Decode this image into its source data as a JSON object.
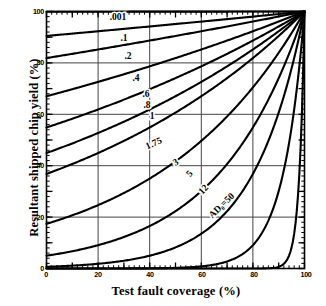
{
  "chart_data": {
    "type": "line",
    "title": "",
    "xlabel": "Test fault coverage (%)",
    "ylabel": "Resultant shipped chip yield (%)",
    "xlim": [
      0,
      100
    ],
    "ylim": [
      0,
      100
    ],
    "xticks": [
      "0",
      "20",
      "40",
      "60",
      "80",
      "100"
    ],
    "yticks": [
      "0",
      "20",
      "40",
      "60",
      "80",
      "100"
    ],
    "xtick_values": [
      0,
      20,
      40,
      60,
      80,
      100
    ],
    "ytick_values": [
      0,
      20,
      40,
      60,
      80,
      100
    ],
    "grid": true,
    "grid_x": [
      20,
      40,
      60,
      80
    ],
    "grid_y": [
      20,
      40,
      60,
      80
    ],
    "legend": "inline curve labels",
    "legend_position": "inline",
    "annotation": "AD₀=50",
    "model": "Y = exp(-AD₀ (1 - T))",
    "x": [
      0,
      10,
      20,
      30,
      40,
      50,
      60,
      70,
      80,
      90,
      100
    ],
    "series": [
      {
        "name": ".001",
        "label": ".001",
        "ad0": 0.001,
        "values": [
          99.9,
          99.91,
          99.92,
          99.93,
          99.94,
          99.95,
          99.96,
          99.97,
          99.98,
          99.99,
          100
        ]
      },
      {
        "name": ".1",
        "label": ".1",
        "ad0": 0.1,
        "values": [
          90.5,
          91.4,
          92.3,
          93.2,
          94.2,
          95.1,
          96.1,
          97.0,
          98.0,
          99.0,
          100
        ]
      },
      {
        "name": ".2",
        "label": ".2",
        "ad0": 0.2,
        "values": [
          81.9,
          83.5,
          85.2,
          86.9,
          88.7,
          90.5,
          92.3,
          94.2,
          96.1,
          98.0,
          100
        ]
      },
      {
        "name": ".4",
        "label": ".4",
        "ad0": 0.4,
        "values": [
          67.0,
          69.8,
          72.6,
          75.6,
          78.7,
          81.9,
          85.2,
          88.7,
          92.3,
          96.1,
          100
        ]
      },
      {
        "name": ".6",
        "label": ".6",
        "ad0": 0.6,
        "values": [
          54.9,
          58.3,
          61.9,
          65.7,
          69.8,
          74.1,
          78.7,
          83.5,
          88.7,
          94.2,
          100
        ]
      },
      {
        "name": ".8",
        "label": ".8",
        "ad0": 0.8,
        "values": [
          44.9,
          48.7,
          52.7,
          57.1,
          61.9,
          67.0,
          72.6,
          78.7,
          85.2,
          92.3,
          100
        ]
      },
      {
        "name": "1",
        "label": "1",
        "ad0": 1.0,
        "values": [
          36.8,
          40.7,
          44.9,
          49.7,
          54.9,
          60.7,
          67.0,
          74.1,
          81.9,
          90.5,
          100
        ]
      },
      {
        "name": "1.75",
        "label": "1.75",
        "ad0": 1.75,
        "values": [
          17.4,
          20.7,
          24.7,
          29.4,
          35.0,
          41.7,
          49.7,
          59.2,
          70.5,
          84.0,
          100
        ]
      },
      {
        "name": "3",
        "label": "3",
        "ad0": 3.0,
        "values": [
          5.0,
          6.7,
          9.1,
          12.2,
          16.5,
          22.3,
          30.1,
          40.7,
          54.9,
          74.1,
          100
        ]
      },
      {
        "name": "5",
        "label": "5",
        "ad0": 5.0,
        "values": [
          0.67,
          1.11,
          1.83,
          3.02,
          4.98,
          8.21,
          13.5,
          22.3,
          36.8,
          60.7,
          100
        ]
      },
      {
        "name": "12",
        "label": "12",
        "ad0": 12.0,
        "values": [
          0.0006,
          0.002,
          0.008,
          0.025,
          0.082,
          0.248,
          0.82,
          2.7,
          9.07,
          30.1,
          100
        ]
      },
      {
        "name": "AD0=50",
        "label": "AD₀=50",
        "ad0": 50.0,
        "values": [
          0,
          0,
          0,
          0,
          0,
          0,
          0,
          3.1e-06,
          0.0045,
          0.67,
          100
        ]
      }
    ],
    "curve_labels": [
      {
        "text": ".001",
        "x": 118,
        "y": 18,
        "rotate": 0
      },
      {
        "text": ".1",
        "x": 124,
        "y": 39,
        "rotate": 0
      },
      {
        "text": ".2",
        "x": 128,
        "y": 57,
        "rotate": 0
      },
      {
        "text": ".4",
        "x": 136,
        "y": 79,
        "rotate": 0
      },
      {
        "text": ".6",
        "x": 146,
        "y": 95,
        "rotate": 0
      },
      {
        "text": ".8",
        "x": 147,
        "y": 106,
        "rotate": 0
      },
      {
        "text": "1",
        "x": 152,
        "y": 117,
        "rotate": 0
      },
      {
        "text": "1.75",
        "x": 154,
        "y": 144,
        "rotate": -24
      },
      {
        "text": "3",
        "x": 176,
        "y": 163,
        "rotate": -32
      },
      {
        "text": "5",
        "x": 190,
        "y": 174,
        "rotate": -50
      },
      {
        "text": "12",
        "x": 204,
        "y": 190,
        "rotate": -46
      },
      {
        "text": "AD₀=50",
        "x": 222,
        "y": 206,
        "rotate": -44
      }
    ]
  },
  "axis": {
    "x_title": "Test fault coverage (%)",
    "y_title": "Resultant shipped chip yield (%)",
    "x_ticks": [
      "0",
      "20",
      "40",
      "60",
      "80",
      "100"
    ],
    "y_ticks": [
      "100",
      "80",
      "60",
      "40",
      "20",
      "0"
    ]
  },
  "colors": {
    "ink": "#000000",
    "background": "#ffffff",
    "grid": "#444444"
  }
}
